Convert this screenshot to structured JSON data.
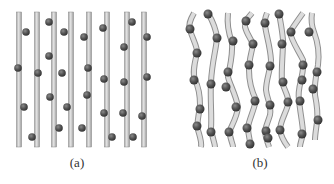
{
  "figure": {
    "panels": [
      {
        "label": "(a)",
        "description": "straight parallel rods with attached spheres",
        "rods_x": [
          19,
          37,
          54,
          71,
          89,
          107,
          127,
          144
        ],
        "rod_top": 12,
        "rod_bottom": 147,
        "spheres": [
          [
            26,
            32
          ],
          [
            49,
            22
          ],
          [
            64,
            32
          ],
          [
            84,
            37
          ],
          [
            103,
            28
          ],
          [
            132,
            22
          ],
          [
            147,
            37
          ],
          [
            124,
            47
          ],
          [
            49,
            56
          ],
          [
            18,
            68
          ],
          [
            38,
            73
          ],
          [
            62,
            73
          ],
          [
            88,
            68
          ],
          [
            104,
            79
          ],
          [
            124,
            82
          ],
          [
            147,
            77
          ],
          [
            50,
            97
          ],
          [
            87,
            95
          ],
          [
            24,
            107
          ],
          [
            67,
            107
          ],
          [
            104,
            113
          ],
          [
            123,
            113
          ],
          [
            142,
            116
          ],
          [
            59,
            128
          ],
          [
            82,
            128
          ],
          [
            32,
            137
          ],
          [
            112,
            137
          ],
          [
            133,
            137
          ]
        ]
      },
      {
        "label": "(b)",
        "description": "wavy rods with attached spheres",
        "rods": [
          "M194,13 C190,20 188,25 190,30 C193,40 198,48 197,53 C195,62 192,72 195,80 C199,88 200,95 200,105 C199,115 196,125 198,130 C200,137 202,142 201,147",
          "M208,13 C212,20 216,28 217,38 C216,50 212,62 211,82 C210,100 212,115 211,128 C212,138 215,143 215,147",
          "M228,13 C227,22 228,32 232,42 C233,55 230,65 228,77 C230,85 236,95 238,107 C237,117 232,125 230,130 C229,138 233,143 233,147",
          "M252,13 C248,18 244,21 245,27 C247,35 252,40 253,45 C251,55 249,60 249,70 C249,80 252,92 256,100 C254,110 249,120 248,127 C248,135 250,140 251,147",
          "M267,13 C265,18 264,21 265,25 C266,35 270,45 271,60 C270,72 266,80 266,90 C267,100 272,105 270,115 C268,122 265,128 265,132 C266,140 268,143 269,147",
          "M279,13 C280,20 282,28 283,40 C283,55 281,70 282,82 C285,92 290,98 288,105 C285,115 280,122 280,130 C281,137 285,143 288,147",
          "M303,13 C298,20 293,27 290,32 C291,40 298,50 303,60 C304,68 302,75 301,80 C299,88 298,95 299,100 C300,112 303,125 303,133 C302,140 300,143 300,147",
          "M312,13 C311,20 312,27 314,32 C317,40 320,50 318,65 C316,75 314,85 315,95 C317,105 318,115 317,122 C316,130 315,135 315,140"
        ],
        "spheres": [
          [
            208,
            14
          ],
          [
            190,
            29
          ],
          [
            217,
            38
          ],
          [
            197,
            53
          ],
          [
            233,
            41
          ],
          [
            246,
            21
          ],
          [
            265,
            23
          ],
          [
            279,
            14
          ],
          [
            291,
            32
          ],
          [
            309,
            32
          ],
          [
            253,
            44
          ],
          [
            282,
            44
          ],
          [
            194,
            80
          ],
          [
            211,
            84
          ],
          [
            228,
            72
          ],
          [
            249,
            65
          ],
          [
            270,
            66
          ],
          [
            303,
            65
          ],
          [
            317,
            72
          ],
          [
            283,
            82
          ],
          [
            226,
            87
          ],
          [
            302,
            80
          ],
          [
            313,
            89
          ],
          [
            255,
            101
          ],
          [
            236,
            107
          ],
          [
            270,
            105
          ],
          [
            288,
            102
          ],
          [
            300,
            101
          ],
          [
            200,
            109
          ],
          [
            197,
            126
          ],
          [
            211,
            132
          ],
          [
            229,
            132
          ],
          [
            247,
            128
          ],
          [
            266,
            131
          ],
          [
            280,
            130
          ],
          [
            302,
            134
          ],
          [
            318,
            120
          ],
          [
            250,
            144
          ],
          [
            268,
            138
          ]
        ]
      }
    ]
  }
}
